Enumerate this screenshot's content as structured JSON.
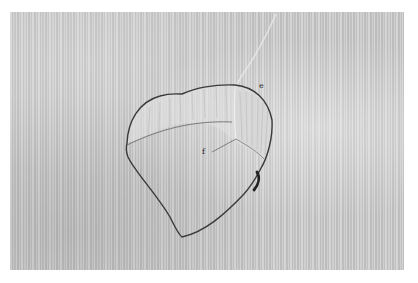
{
  "image": {
    "type": "grayscale photograph",
    "subject": "heart-shaped specimen on striped background",
    "background_color": "#c9c9c9",
    "outline_color": "#3a3a3a"
  },
  "labels": [
    {
      "id": "e",
      "text": "e"
    },
    {
      "id": "f",
      "text": "f"
    }
  ]
}
